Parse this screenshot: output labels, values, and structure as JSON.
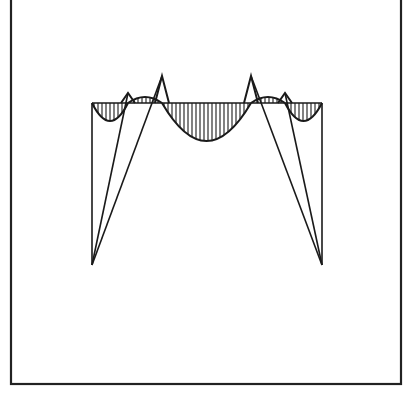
{
  "figure": {
    "kind": "line-drawing",
    "background_color": "#ffffff",
    "ink_color": "#1a1a1a"
  },
  "frame": {
    "name": "outer-border-rectangle",
    "x": 11,
    "y": -6,
    "width": 390,
    "height": 390,
    "stroke_width": 2.2,
    "stroke_color": "#222222",
    "fill": "none"
  },
  "chart_data": {
    "type": "line",
    "xlabel": "",
    "ylabel": "",
    "grid": false,
    "legend_position": "none",
    "xlim": [
      92,
      322
    ],
    "ylim": [
      265,
      74
    ],
    "baseline_y": 103,
    "baseline": {
      "name": "horizontal-baseline",
      "x_start": 92,
      "x_end": 322,
      "y": 103
    },
    "left_support_edge": {
      "name": "left-vertical-edge",
      "x": 92,
      "y_top": 103,
      "y_bottom": 265
    },
    "right_support_edge": {
      "name": "right-vertical-edge",
      "x": 322,
      "y_top": 103,
      "y_bottom": 265
    },
    "apex_points": [
      {
        "name": "left-apex",
        "x": 92,
        "y": 265
      },
      {
        "name": "right-apex",
        "x": 322,
        "y": 265
      }
    ],
    "peaks": [
      {
        "name": "peak-1",
        "x": 128,
        "y": 93,
        "height_above_baseline": 10
      },
      {
        "name": "peak-2",
        "x": 162,
        "y": 76,
        "height_above_baseline": 27
      },
      {
        "name": "peak-3",
        "x": 251,
        "y": 76,
        "height_above_baseline": 27
      },
      {
        "name": "peak-4",
        "x": 285,
        "y": 93,
        "height_above_baseline": 10
      }
    ],
    "diagonals": [
      {
        "name": "diagonal-peak1-to-left-apex",
        "x1": 128,
        "y1": 93,
        "x2": 92,
        "y2": 265
      },
      {
        "name": "diagonal-peak2-to-left-apex",
        "x1": 162,
        "y1": 76,
        "x2": 92,
        "y2": 265
      },
      {
        "name": "diagonal-peak3-to-right-apex",
        "x1": 251,
        "y1": 76,
        "x2": 322,
        "y2": 265
      },
      {
        "name": "diagonal-peak4-to-right-apex",
        "x1": 285,
        "y1": 93,
        "x2": 322,
        "y2": 265
      }
    ],
    "lobes": [
      {
        "name": "lobe-left-edge",
        "x_start": 92,
        "x_end": 128,
        "depth_below_baseline": 18,
        "direction": "down",
        "hatched": true
      },
      {
        "name": "lobe-between-peak1-peak2",
        "x_start": 128,
        "x_end": 162,
        "depth_below_baseline": -6,
        "direction": "up",
        "hatched": true
      },
      {
        "name": "lobe-center",
        "x_start": 162,
        "x_end": 251,
        "depth_below_baseline": 38,
        "direction": "down",
        "hatched": true
      },
      {
        "name": "lobe-between-peak3-peak4",
        "x_start": 251,
        "x_end": 285,
        "depth_below_baseline": -6,
        "direction": "up",
        "hatched": true
      },
      {
        "name": "lobe-right-edge",
        "x_start": 285,
        "x_end": 322,
        "depth_below_baseline": 18,
        "direction": "down",
        "hatched": true
      }
    ],
    "hatching": {
      "name": "vertical-hatch-pattern",
      "orientation": "vertical",
      "spacing_px": 4,
      "stroke_width": 1.1,
      "stroke_color": "#1a1a1a"
    },
    "stroke": {
      "curve_stroke_width": 2.0,
      "line_stroke_width": 1.6,
      "color": "#1a1a1a"
    }
  }
}
